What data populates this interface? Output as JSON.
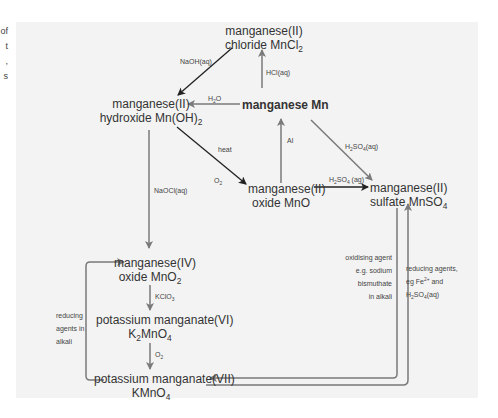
{
  "side_text_fragment": [
    "of",
    "t",
    ",",
    "s"
  ],
  "nodes": {
    "chloride": {
      "line1": "manganese(II)",
      "line2_prefix": "chloride MnCl",
      "line2_sub": "2"
    },
    "hydroxide": {
      "line1": "manganese(II)",
      "line2_prefix": "hydroxide Mn(OH)",
      "line2_sub": "2"
    },
    "metal": {
      "label": "manganese Mn"
    },
    "oxide_ii": {
      "line1": "manganese(II)",
      "line2": "oxide MnO"
    },
    "sulfate": {
      "line1": "manganese(II)",
      "line2_prefix": "sulfate MnSO",
      "line2_sub": "4"
    },
    "oxide_iv": {
      "line1": "manganese(IV)",
      "line2_prefix": "oxide MnO",
      "line2_sub": "2"
    },
    "manganate_vi": {
      "line1": "potassium manganate(VI)",
      "line2_a": "K",
      "line2_sub1": "2",
      "line2_b": "MnO",
      "line2_sub2": "4"
    },
    "manganate_vii": {
      "line1": "potassium manganate(VII)",
      "line2_prefix": "KMnO",
      "line2_sub": "4"
    }
  },
  "reagents": {
    "naoh": "NaOH(aq)",
    "hcl": "HCl(aq)",
    "h2o": {
      "a": "H",
      "sub": "2",
      "b": "O"
    },
    "al": "Al",
    "heat": "heat",
    "o2_top": {
      "a": "O",
      "sub": "2"
    },
    "naocl": "NaOCl(aq)",
    "h2so4_diag": {
      "a": "H",
      "sub1": "2",
      "b": "SO",
      "sub2": "4",
      "c": "(aq)"
    },
    "h2so4_horiz": {
      "a": "H",
      "sub1": "2",
      "b": "SO",
      "sub2": "4",
      "c": " (ag)"
    },
    "kclo3": {
      "a": "KClO",
      "sub": "3"
    },
    "o2_bottom": {
      "a": "O",
      "sub": "2"
    }
  },
  "notes": {
    "oxidising": [
      "oxidising agent",
      "e.g. sodium",
      "bismuthate",
      "in alkali"
    ],
    "reducing_right": {
      "l1": "reducing agents,",
      "l2a": "eg Fe",
      "l2sup": "2+",
      "l2b": " and",
      "l3a": "H",
      "l3sub1": "2",
      "l3b": "SO",
      "l3sub2": "4",
      "l3c": "(aq)"
    },
    "reducing_left": [
      "reducing",
      "agents in",
      "alkali"
    ]
  },
  "colors": {
    "panel_bg": "#f3f3f3",
    "arrow_black": "#222222",
    "arrow_gray": "#7a7a7a"
  }
}
